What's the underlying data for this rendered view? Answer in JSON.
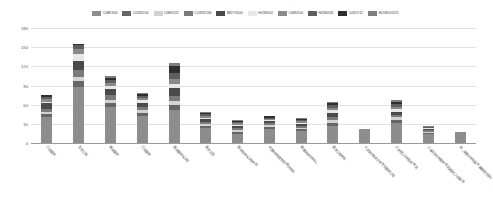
{
  "chart_data": {
    "type": "bar",
    "stacked": true,
    "title": "",
    "subtitle": "",
    "xlabel": "",
    "ylabel": "",
    "ylim": [
      0,
      180
    ],
    "yticks": [
      "180",
      "150",
      "120",
      "90",
      "60",
      "30",
      "0"
    ],
    "grid": true,
    "legend_position": "top",
    "categories": [
      "口腔医学",
      "生物工程",
      "临床医学",
      "口腔医学",
      "基础医学与工程",
      "医药卫生",
      "医学技术与工程学院",
      "中国科学院生物物理研究所",
      "国家纳米科学中心",
      "医学工程学院",
      "北京航空航天大学生物医学工程",
      "北京理工大学生命学院",
      "上海交通大学医学院附属第九人民医院",
      "第二军医大学附属长海医院口腔科"
    ],
    "series": [
      {
        "name": "C0BK3/04",
        "color": "#8d8d8d",
        "values": [
          41,
          88,
          57,
          42,
          52,
          24,
          14,
          22,
          19,
          27,
          22,
          31,
          14,
          18
        ]
      },
      {
        "name": "C01831/04",
        "color": "#666666",
        "values": [
          4,
          9,
          6,
          5,
          7,
          3,
          4,
          3,
          3,
          4,
          0,
          5,
          2,
          0
        ]
      },
      {
        "name": "C0BK3/22",
        "color": "#d3d3d3",
        "values": [
          3,
          7,
          5,
          4,
          6,
          3,
          3,
          3,
          2,
          5,
          0,
          4,
          2,
          0
        ]
      },
      {
        "name": "C01832/184",
        "color": "#7a7a7a",
        "values": [
          5,
          10,
          7,
          5,
          8,
          3,
          3,
          3,
          3,
          5,
          0,
          4,
          2,
          0
        ]
      },
      {
        "name": "B82Y30/00",
        "color": "#4a4a4a",
        "values": [
          9,
          15,
          9,
          7,
          13,
          4,
          3,
          3,
          3,
          6,
          0,
          5,
          2,
          0
        ]
      },
      {
        "name": "H01M4/62",
        "color": "#e8e8e8",
        "values": [
          3,
          10,
          5,
          4,
          7,
          2,
          2,
          2,
          2,
          4,
          0,
          4,
          1,
          0
        ]
      },
      {
        "name": "C0BK3/04",
        "color": "#8a8a8a",
        "values": [
          4,
          8,
          5,
          4,
          8,
          3,
          2,
          2,
          2,
          4,
          0,
          4,
          1,
          0
        ]
      },
      {
        "name": "H01M4/36",
        "color": "#5f5f5f",
        "values": [
          3,
          6,
          4,
          3,
          8,
          3,
          2,
          2,
          2,
          4,
          0,
          4,
          1,
          0
        ]
      },
      {
        "name": "C09D7/12",
        "color": "#2e2e2e",
        "values": [
          3,
          2,
          4,
          3,
          12,
          2,
          2,
          2,
          2,
          3,
          0,
          4,
          1,
          0
        ]
      },
      {
        "name": "H01M10/0525",
        "color": "#7f7f7f",
        "values": [
          0,
          0,
          3,
          1,
          4,
          1,
          1,
          1,
          1,
          2,
          0,
          3,
          1,
          0
        ]
      }
    ]
  }
}
